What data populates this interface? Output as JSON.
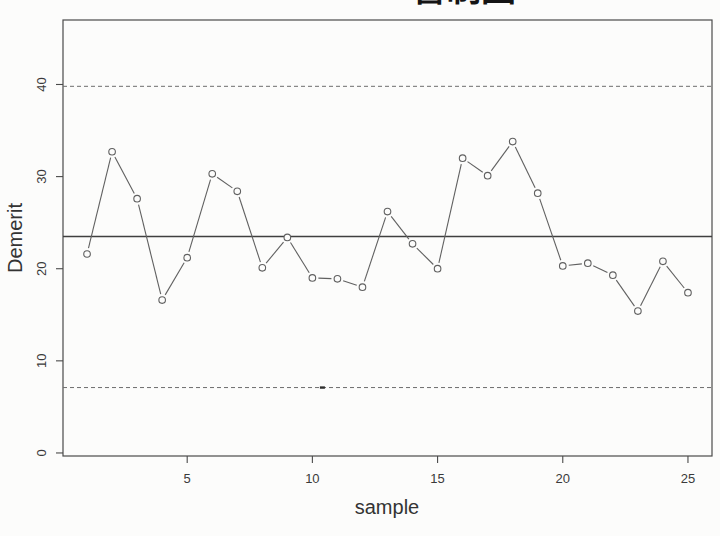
{
  "page": {
    "background": "#fcfcfb",
    "kind": "scanned R plot"
  },
  "chart_data": {
    "type": "line",
    "subtype": "demerit-control-chart",
    "title": "管制图",
    "xlabel": "sample",
    "ylabel": "Demerit",
    "x": [
      1,
      2,
      3,
      4,
      5,
      6,
      7,
      8,
      9,
      10,
      11,
      12,
      13,
      14,
      15,
      16,
      17,
      18,
      19,
      20,
      21,
      22,
      23,
      24,
      25
    ],
    "values": [
      21.6,
      32.7,
      27.6,
      16.6,
      21.2,
      30.3,
      28.4,
      20.1,
      23.4,
      19.0,
      18.9,
      18.0,
      26.2,
      22.7,
      20.0,
      32.0,
      30.1,
      33.8,
      28.2,
      20.3,
      20.6,
      19.3,
      15.4,
      20.8,
      17.4
    ],
    "center_line": 23.5,
    "ucl": 39.8,
    "lcl": 7.1,
    "xticks": [
      5,
      10,
      15,
      20,
      25
    ],
    "yticks": [
      0,
      10,
      20,
      30,
      40
    ],
    "xlim": [
      0.04,
      25.96
    ],
    "ylim": [
      -0.33,
      47.0
    ],
    "grid": false,
    "legend_position": "none",
    "point_marker": "open-circle",
    "limit_line_style": "dashed",
    "scan_artifact_x_on_lcl": 10.4,
    "colors": {
      "data_line": "#606060",
      "point_stroke": "#606060",
      "center_line": "#3f3f3f",
      "limit_line": "#6e6e6e",
      "axis_box": "#4a4a4a",
      "tick_text": "#3a3a3a",
      "title_text": "#141414",
      "background": "#fcfcfb"
    }
  }
}
